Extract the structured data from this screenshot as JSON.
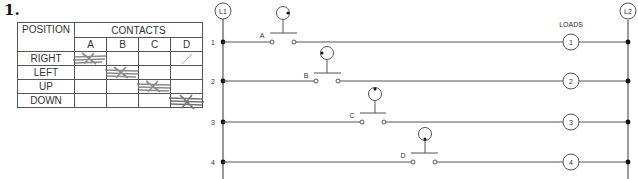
{
  "problem_number": "1.",
  "table": {
    "position_header": "POSITION",
    "contacts_header": "CONTACTS",
    "contact_labels": [
      "A",
      "B",
      "C",
      "D"
    ],
    "rows": [
      {
        "position": "RIGHT",
        "marks": [
          "X",
          "",
          "",
          "/"
        ]
      },
      {
        "position": "LEFT",
        "marks": [
          "",
          "X",
          "",
          ""
        ]
      },
      {
        "position": "UP",
        "marks": [
          "",
          "",
          "X",
          ""
        ]
      },
      {
        "position": "DOWN",
        "marks": [
          "",
          "",
          "",
          "X"
        ]
      }
    ]
  },
  "ladder": {
    "left_rail_label": "L1",
    "right_rail_label": "L2",
    "loads_label": "LOADS",
    "rungs": [
      {
        "number": "1",
        "contact": "A",
        "load": "1",
        "joystick_dot": "right"
      },
      {
        "number": "2",
        "contact": "B",
        "load": "2",
        "joystick_dot": "left"
      },
      {
        "number": "3",
        "contact": "C",
        "load": "3",
        "joystick_dot": "up"
      },
      {
        "number": "4",
        "contact": "D",
        "load": "4",
        "joystick_dot": "down"
      }
    ]
  },
  "colors": {
    "line": "#555555",
    "pencil_mark": "#777777",
    "dot": "#111111"
  }
}
